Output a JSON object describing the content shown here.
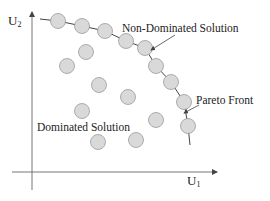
{
  "diagram": {
    "axes": {
      "x_label": "U",
      "x_sub": "1",
      "y_label": "U",
      "y_sub": "2"
    },
    "labels": {
      "non_dominated": "Non-Dominated Solution",
      "pareto_front": "Pareto Front",
      "dominated": "Dominated Solution"
    },
    "colors": {
      "circle_fill": "#d9d9d9",
      "circle_stroke": "#9a9a9a",
      "line": "#444444",
      "axis": "#777777"
    },
    "pareto_points": [
      [
        58,
        21
      ],
      [
        82,
        26
      ],
      [
        105,
        31
      ],
      [
        126,
        41
      ],
      [
        145,
        48
      ],
      [
        156,
        66
      ],
      [
        171,
        82
      ],
      [
        184,
        102
      ],
      [
        188,
        126
      ]
    ],
    "dominated_points": [
      [
        86,
        52
      ],
      [
        67,
        66
      ],
      [
        99,
        85
      ],
      [
        128,
        97
      ],
      [
        82,
        111
      ],
      [
        156,
        120
      ],
      [
        136,
        140
      ],
      [
        98,
        142
      ]
    ]
  }
}
